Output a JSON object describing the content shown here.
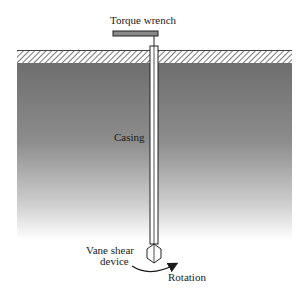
{
  "diagram": {
    "labels": {
      "torque_wrench": "Torque wrench",
      "casing": "Casing",
      "vane_device_line1": "Vane shear",
      "vane_device_line2": "device",
      "rotation": "Rotation"
    },
    "colors": {
      "soil_top": "#6e6e6e",
      "soil_bottom": "#ffffff",
      "hatch": "#555555",
      "wrench": "#8a8a8a",
      "outline": "#222222"
    }
  }
}
